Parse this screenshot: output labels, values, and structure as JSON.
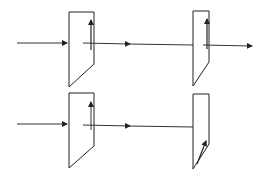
{
  "diagram": {
    "colors": {
      "line": "#222222",
      "background": "#ffffff"
    },
    "rows": [
      {
        "id": "parallel",
        "polarizer_1_axis": "vertical",
        "polarizer_2_axis": "vertical",
        "transmitted": true
      },
      {
        "id": "crossed",
        "polarizer_1_axis": "vertical",
        "polarizer_2_axis": "diagonal",
        "transmitted": false
      }
    ]
  }
}
